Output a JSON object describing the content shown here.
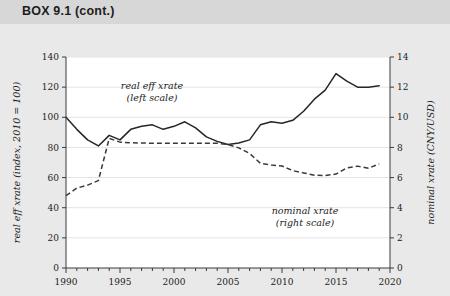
{
  "box": {
    "header_label": "BOX 9.1 (cont.)"
  },
  "chart_data": {
    "type": "line",
    "title": "",
    "subtitle": "",
    "xlabel": "",
    "grid": true,
    "legend_position": "inline-annotations",
    "xlim": [
      1990,
      2020
    ],
    "xticks": [
      1990,
      1995,
      2000,
      2005,
      2010,
      2015,
      2020
    ],
    "xtick_labels": [
      "1990",
      "1995",
      "2000",
      "2005",
      "2010",
      "2015",
      "2020"
    ],
    "x_minor_tick_step": 1,
    "axes": [
      {
        "id": "left",
        "label": "real eff xrate (index, 2010 = 100)",
        "lim": [
          0,
          140
        ],
        "ticks": [
          0,
          20,
          40,
          60,
          80,
          100,
          120,
          140
        ],
        "tick_labels": [
          "0",
          "20",
          "40",
          "60",
          "80",
          "100",
          "120",
          "140"
        ]
      },
      {
        "id": "right",
        "label": "nominal xrate (CNY/USD)",
        "lim": [
          0,
          14
        ],
        "ticks": [
          0,
          2,
          4,
          6,
          8,
          10,
          12,
          14
        ],
        "tick_labels": [
          "0",
          "2",
          "4",
          "6",
          "8",
          "10",
          "12",
          "14"
        ]
      }
    ],
    "x": [
      1990,
      1991,
      1992,
      1993,
      1994,
      1995,
      1996,
      1997,
      1998,
      1999,
      2000,
      2001,
      2002,
      2003,
      2004,
      2005,
      2006,
      2007,
      2008,
      2009,
      2010,
      2011,
      2012,
      2013,
      2014,
      2015,
      2016,
      2017,
      2018,
      2019
    ],
    "series": [
      {
        "name": "real eff xrate",
        "axis": "left",
        "style": "solid",
        "annotation": "real eff xrate\n(left scale)",
        "annotation_line1": "real eff xrate",
        "annotation_line2": "(left scale)",
        "color": "#262626",
        "values": [
          100,
          92,
          85,
          81,
          88,
          85,
          92,
          94,
          95,
          92,
          94,
          97,
          93,
          87,
          84,
          82,
          83,
          85,
          95,
          97,
          96,
          98,
          104,
          112,
          118,
          129,
          124,
          120,
          120,
          121
        ]
      },
      {
        "name": "nominal xrate",
        "axis": "right",
        "style": "dashed",
        "annotation": "nominal xrate\n(right scale)",
        "annotation_line1": "nominal xrate",
        "annotation_line2": "(right scale)",
        "color": "#3a3a3a",
        "values": [
          4.8,
          5.3,
          5.5,
          5.8,
          8.6,
          8.35,
          8.31,
          8.29,
          8.28,
          8.28,
          8.28,
          8.28,
          8.28,
          8.28,
          8.28,
          8.19,
          7.97,
          7.6,
          6.95,
          6.83,
          6.77,
          6.46,
          6.31,
          6.15,
          6.14,
          6.23,
          6.64,
          6.76,
          6.62,
          6.9
        ]
      }
    ],
    "annotations": [
      {
        "id": "real-eff-xrate-annotation",
        "line1": "real eff xrate",
        "line2": "(left scale)"
      },
      {
        "id": "nominal-xrate-annotation",
        "line1": "nominal xrate",
        "line2": "(right scale)"
      }
    ]
  }
}
